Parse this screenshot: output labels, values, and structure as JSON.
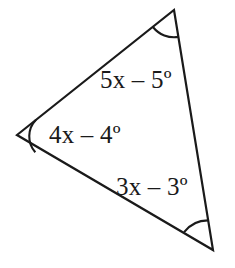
{
  "figure": {
    "type": "triangle-angle-diagram",
    "background_color": "#ffffff",
    "stroke_color": "#1a1a1a",
    "text_color": "#1a1a1a",
    "labels": {
      "top_right_side": "5x – 5º",
      "left_vertex": "4x – 4º",
      "bottom_right_side": "3x – 3º"
    },
    "vertices": {
      "top": "(174, 10)",
      "left": "(17, 135)",
      "bottom_right": "(213, 250)"
    },
    "angle_expressions": [
      "5x – 5º",
      "4x – 4º",
      "3x – 3º"
    ]
  }
}
